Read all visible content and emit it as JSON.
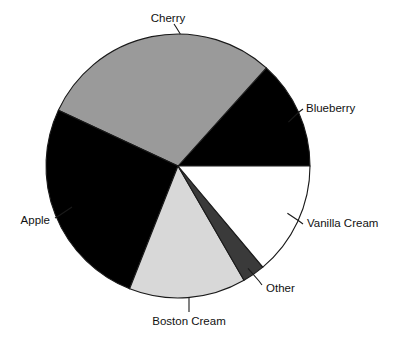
{
  "chart_data": {
    "type": "pie",
    "title": "",
    "subtitle": "",
    "xlabel": "",
    "ylabel": "",
    "legend_position": "none",
    "grid": false,
    "labels_placement": "outside-with-leader-lines",
    "start_angle_deg": 0,
    "direction": "counterclockwise",
    "categories": [
      "Blueberry",
      "Cherry",
      "Apple",
      "Boston Cream",
      "Other",
      "Vanilla Cream"
    ],
    "values": [
      13.3,
      29.7,
      26.0,
      14.3,
      2.8,
      13.9
    ],
    "value_unit": "percent",
    "slices": [
      {
        "label": "Blueberry",
        "value": 13.3,
        "start_angle_deg": 0.0,
        "end_angle_deg": 48.0,
        "sweep_deg": 48.0,
        "color": "#000000",
        "label_x": 306,
        "label_y": 109,
        "label_anchor": "start",
        "leader": [
          [
            288.4,
            122.1
          ],
          [
            299,
            112
          ],
          [
            303,
            109
          ]
        ]
      },
      {
        "label": "Cherry",
        "value": 29.7,
        "start_angle_deg": 48.0,
        "end_angle_deg": 155.0,
        "sweep_deg": 107.0,
        "color": "#9a9a9a",
        "label_x": 168,
        "label_y": 19,
        "label_anchor": "mid",
        "leader": [
          [
            180.3,
            34.0
          ],
          [
            176,
            27
          ],
          [
            174,
            24
          ]
        ]
      },
      {
        "label": "Apple",
        "value": 26.0,
        "start_angle_deg": 155.0,
        "end_angle_deg": 248.5,
        "sweep_deg": 93.5,
        "color": "#000000",
        "label_x": 50,
        "label_y": 221,
        "label_anchor": "end",
        "leader": [
          [
            72.0,
            207.0
          ],
          [
            60,
            215
          ],
          [
            55,
            218
          ]
        ]
      },
      {
        "label": "Boston Cream",
        "value": 14.3,
        "start_angle_deg": 248.5,
        "end_angle_deg": 300.0,
        "sweep_deg": 51.5,
        "color": "#d8d8d8",
        "label_x": 189,
        "label_y": 322,
        "label_anchor": "mid",
        "leader": [
          [
            189.0,
            297.8
          ],
          [
            189,
            308
          ],
          [
            189,
            312
          ]
        ]
      },
      {
        "label": "Other",
        "value": 2.8,
        "start_angle_deg": 300.0,
        "end_angle_deg": 310.0,
        "sweep_deg": 10.0,
        "color": "#3a3a3a",
        "label_x": 266,
        "label_y": 289,
        "label_anchor": "start",
        "leader": [
          [
            248.0,
            268.4
          ],
          [
            259,
            281
          ],
          [
            262,
            285
          ]
        ]
      },
      {
        "label": "Vanilla Cream",
        "value": 13.9,
        "start_angle_deg": 310.0,
        "end_angle_deg": 360.0,
        "sweep_deg": 50.0,
        "color": "#ffffff",
        "label_x": 307,
        "label_y": 224,
        "label_anchor": "start",
        "leader": [
          [
            287.4,
            213.2
          ],
          [
            299,
            221
          ],
          [
            303,
            224
          ]
        ]
      }
    ],
    "geometry": {
      "center_x": 178,
      "center_y": 166,
      "radius": 132
    },
    "style": {
      "background": "#ffffff",
      "outline": "#1a1a1a",
      "label_color": "#111111"
    }
  }
}
